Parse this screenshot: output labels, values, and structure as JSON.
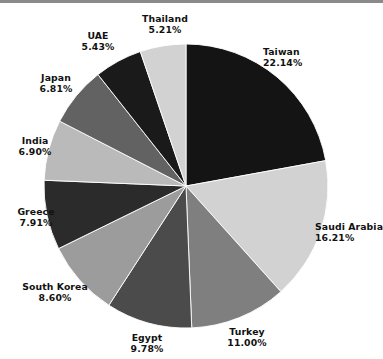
{
  "chart_data": {
    "type": "pie",
    "title": "",
    "subtitle": "",
    "xlabel": "",
    "ylabel": "",
    "legend_position": "outside-labels",
    "grid": false,
    "units": "percent",
    "start_angle_deg": 0,
    "direction": "clockwise",
    "categories": [
      "Taiwan",
      "Saudi Arabia",
      "Turkey",
      "Egypt",
      "South Korea",
      "Greece",
      "India",
      "Japan",
      "UAE",
      "Thailand"
    ],
    "values": [
      22.14,
      16.21,
      11.0,
      9.78,
      8.6,
      7.91,
      6.9,
      6.81,
      5.43,
      5.21
    ],
    "value_labels": [
      "22.14%",
      "16.21%",
      "11.00%",
      "9.78%",
      "8.60%",
      "7.91%",
      "6.90%",
      "6.81%",
      "5.43%",
      "5.21%"
    ],
    "colors": [
      "#141414",
      "#d2d2d2",
      "#7f7f7f",
      "#4b4b4b",
      "#9c9c9c",
      "#2b2b2b",
      "#bababa",
      "#626262",
      "#1a1a1a",
      "#d2d2d2"
    ],
    "slices": [
      {
        "label": "Taiwan",
        "value": 22.14,
        "value_label": "22.14%",
        "color": "#141414"
      },
      {
        "label": "Saudi Arabia",
        "value": 16.21,
        "value_label": "16.21%",
        "color": "#d2d2d2"
      },
      {
        "label": "Turkey",
        "value": 11.0,
        "value_label": "11.00%",
        "color": "#7f7f7f"
      },
      {
        "label": "Egypt",
        "value": 9.78,
        "value_label": "9.78%",
        "color": "#4b4b4b"
      },
      {
        "label": "South Korea",
        "value": 8.6,
        "value_label": "8.60%",
        "color": "#9c9c9c"
      },
      {
        "label": "Greece",
        "value": 7.91,
        "value_label": "7.91%",
        "color": "#2b2b2b"
      },
      {
        "label": "India",
        "value": 6.9,
        "value_label": "6.90%",
        "color": "#bababa"
      },
      {
        "label": "Japan",
        "value": 6.81,
        "value_label": "6.81%",
        "color": "#626262"
      },
      {
        "label": "UAE",
        "value": 5.43,
        "value_label": "5.43%",
        "color": "#1a1a1a"
      },
      {
        "label": "Thailand",
        "value": 5.21,
        "value_label": "5.21%",
        "color": "#d2d2d2"
      }
    ]
  },
  "geometry": {
    "center_x": 186,
    "center_y": 186,
    "radius": 142
  }
}
